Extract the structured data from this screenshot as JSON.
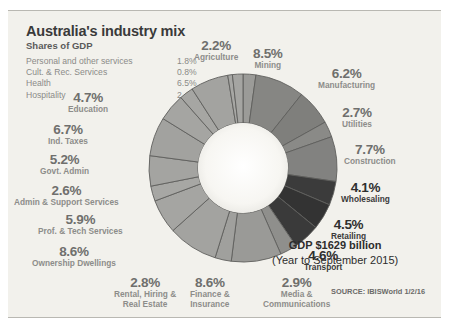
{
  "panel": {
    "title": "Australia's industry mix",
    "subtitle": "Shares of GDP",
    "bg_color": "#f2f1ec"
  },
  "legend": [
    {
      "label": "Personal and other services",
      "value": "1.8%"
    },
    {
      "label": "Cult. & Rec. Services",
      "value": "0.8%"
    },
    {
      "label": "Health",
      "value": "6.5%"
    },
    {
      "label": "Hospitality",
      "value": "2.4%"
    }
  ],
  "callouts": [
    {
      "pct": "2.2%",
      "name": "Agriculture"
    },
    {
      "pct": "8.5%",
      "name": "Mining"
    },
    {
      "pct": "6.2%",
      "name": "Manufacturing"
    },
    {
      "pct": "2.7%",
      "name": "Utilities"
    },
    {
      "pct": "7.7%",
      "name": "Construction"
    },
    {
      "pct": "4.1%",
      "name": "Wholesaling"
    },
    {
      "pct": "4.5%",
      "name": "Retailing"
    },
    {
      "pct": "4.6%",
      "name": "Transport"
    },
    {
      "pct": "2.9%",
      "name": "Media &\nCommunications"
    },
    {
      "pct": "8.6%",
      "name": "Finance &\nInsurance"
    },
    {
      "pct": "2.8%",
      "name": "Rental, Hiring &\nReal Estate"
    },
    {
      "pct": "8.6%",
      "name": "Ownership Dwellings"
    },
    {
      "pct": "5.9%",
      "name": "Prof. & Tech Services"
    },
    {
      "pct": "2.6%",
      "name": "Admin & Support Services"
    },
    {
      "pct": "5.2%",
      "name": "Govt. Admin"
    },
    {
      "pct": "6.7%",
      "name": "Ind. Taxes"
    },
    {
      "pct": "4.7%",
      "name": "Education"
    }
  ],
  "gdp": {
    "line1": "GDP $1629 billion",
    "line2": "(Year to September 2015)"
  },
  "source": "SOURCE: IBISWorld 1/2/16",
  "chart_data": {
    "type": "pie",
    "variant": "donut",
    "title": "Australia's industry mix",
    "subtitle": "Shares of GDP",
    "unit": "% of GDP",
    "total_label": "GDP $1629 billion (Year to September 2015)",
    "legend_position": "top-left + radial callouts",
    "grid": false,
    "inner_radius_ratio": 0.48,
    "start_angle_deg": -90,
    "direction": "clockwise",
    "categories": [
      "Agriculture",
      "Mining",
      "Manufacturing",
      "Utilities",
      "Construction",
      "Wholesaling",
      "Retailing",
      "Transport",
      "Media & Communications",
      "Finance & Insurance",
      "Rental, Hiring & Real Estate",
      "Ownership Dwellings",
      "Prof. & Tech Services",
      "Admin & Support Services",
      "Govt. Admin",
      "Ind. Taxes",
      "Education",
      "Hospitality",
      "Health",
      "Cult. & Rec. Services",
      "Personal and other services"
    ],
    "values": [
      2.2,
      8.5,
      6.2,
      2.7,
      7.7,
      4.1,
      4.5,
      4.6,
      2.9,
      8.6,
      2.8,
      8.6,
      5.9,
      2.6,
      5.2,
      6.7,
      4.7,
      2.4,
      6.5,
      0.8,
      1.8
    ],
    "colors": [
      "#9b9b98",
      "#868683",
      "#7f7f7c",
      "#8a8a87",
      "#828280",
      "#3b3b3b",
      "#333333",
      "#3a3a3a",
      "#8f8f8c",
      "#9a9a97",
      "#a0a09d",
      "#a3a3a0",
      "#a5a5a2",
      "#a7a7a4",
      "#a4a4a1",
      "#a2a29f",
      "#a5a5a2",
      "#a6a6a3",
      "#a3a3a0",
      "#a7a7a4",
      "#a5a5a2"
    ],
    "separator_color": "#5f5f5c",
    "center_color": "#f5f4f0"
  }
}
